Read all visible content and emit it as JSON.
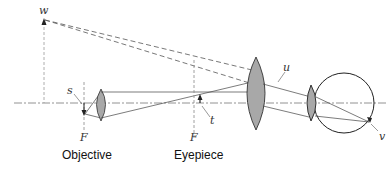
{
  "diagram": {
    "labels": {
      "w": "w",
      "s": "s",
      "t": "t",
      "u": "u",
      "v": "v",
      "focal_objective": "F",
      "focal_eyepiece": "F"
    },
    "captions": {
      "objective": "Objective",
      "eyepiece": "Eyepiece"
    },
    "colors": {
      "line": "#444444",
      "lens_fill": "#a8a8a8",
      "axis": "#777777",
      "background": "#ffffff"
    }
  }
}
